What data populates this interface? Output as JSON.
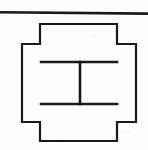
{
  "figure": {
    "title": "Cruciform section outline with inner I-beam",
    "background_color": "#fdfdfc",
    "ink_color": "#1a1a1a",
    "canvas": {
      "width": 148,
      "height": 150
    },
    "elements": {
      "top_rule_label": "top border rule",
      "outer_outline_label": "stepped cruciform outer outline",
      "beam_top_flange_label": "upper flange",
      "beam_bottom_flange_label": "lower flange",
      "beam_web_label": "vertical web"
    }
  },
  "chart_data": {
    "type": "line",
    "title": "Cruciform section outline with inner I-beam",
    "xlabel": "",
    "ylabel": "",
    "xlim": [
      0,
      148
    ],
    "ylim": [
      150,
      0
    ],
    "grid": false,
    "legend": "none",
    "series": [
      {
        "name": "top border rule",
        "stroke_width": 2.6,
        "closed": false,
        "x": [
          0,
          148
        ],
        "y": [
          12.2,
          13.6
        ]
      },
      {
        "name": "stepped cruciform outer outline",
        "stroke_width": 2.2,
        "closed": true,
        "x": [
          40,
          117,
          117,
          136,
          136,
          117,
          117,
          40,
          40,
          22,
          22,
          40
        ],
        "y": [
          24,
          24,
          44,
          44,
          122,
          122,
          141,
          141,
          122,
          122,
          44,
          44
        ]
      },
      {
        "name": "upper flange",
        "stroke_width": 2.6,
        "closed": false,
        "x": [
          41,
          117
        ],
        "y": [
          62,
          62
        ]
      },
      {
        "name": "lower flange",
        "stroke_width": 2.6,
        "closed": false,
        "x": [
          41,
          117
        ],
        "y": [
          104,
          104
        ]
      },
      {
        "name": "vertical web",
        "stroke_width": 2.6,
        "closed": false,
        "x": [
          80,
          80
        ],
        "y": [
          62,
          104
        ]
      }
    ]
  }
}
